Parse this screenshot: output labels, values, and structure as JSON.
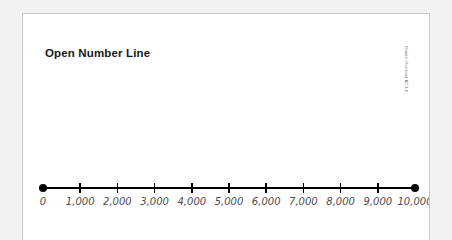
{
  "page": {
    "title": "Open Number Line",
    "attribution": "Number Overhead BC 3.8",
    "background_color": "#ffffff",
    "border_color": "#c8c8c8",
    "canvas_color": "#f2f2f2"
  },
  "chart_data": {
    "type": "line",
    "title": "Open Number Line",
    "xlabel": "",
    "ylabel": "",
    "xlim": [
      0,
      10000
    ],
    "grid": false,
    "legend": null,
    "tick_interval": 1000,
    "tick_values": [
      0,
      1000,
      2000,
      3000,
      4000,
      5000,
      6000,
      7000,
      8000,
      9000,
      10000
    ],
    "tick_labels": [
      "0",
      "1,000",
      "2,000",
      "3,000",
      "4,000",
      "5,000",
      "6,000",
      "7,000",
      "8,000",
      "9,000",
      "10,000"
    ],
    "endpoints": [
      {
        "value": 0,
        "label": "0",
        "marker": "filled-circle"
      },
      {
        "value": 10000,
        "label": "10,000",
        "marker": "filled-circle"
      }
    ],
    "line_color": "#000000",
    "label_color": "#4d4d4d",
    "plotted_points": []
  }
}
